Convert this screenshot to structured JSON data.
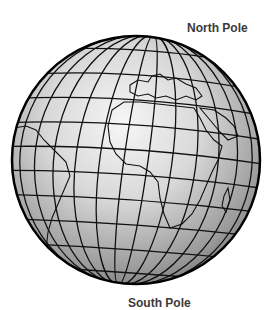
{
  "labels": {
    "north": "North Pole",
    "south": "South Pole"
  },
  "globe": {
    "description": "Shaded globe with latitude/longitude grid showing Europe, Africa and South America",
    "center": [
      136,
      160
    ],
    "radius": 124,
    "colors": {
      "highlight": "#f4f4f4",
      "shade": "#8a8a8a",
      "grid": "#111111",
      "outline": "#000000"
    }
  }
}
